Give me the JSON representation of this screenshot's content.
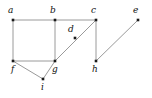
{
  "figure": {
    "name": "undirected-graph-diagram",
    "width": 152,
    "height": 98,
    "background_color": "#ffffff",
    "edge_color": "#9a9a9a",
    "vertex_color": "#1a1a1a",
    "label_color": "#111111",
    "edge_width": 1,
    "vertex_size": 2.6
  },
  "chart_data": {
    "type": "diagram",
    "title": "",
    "vertices": [
      {
        "id": "a",
        "label": "a",
        "x": 13,
        "y": 20,
        "label_x": 8,
        "label_y": 6,
        "degree": 2
      },
      {
        "id": "b",
        "label": "b",
        "x": 55,
        "y": 20,
        "label_x": 50,
        "label_y": 6,
        "degree": 3
      },
      {
        "id": "c",
        "label": "c",
        "x": 96,
        "y": 20,
        "label_x": 91,
        "label_y": 6,
        "degree": 3
      },
      {
        "id": "d",
        "label": "d",
        "x": 75,
        "y": 38,
        "label_x": 68,
        "label_y": 25,
        "degree": 0
      },
      {
        "id": "e",
        "label": "e",
        "x": 138,
        "y": 20,
        "label_x": 133,
        "label_y": 6,
        "degree": 1
      },
      {
        "id": "f",
        "label": "f",
        "x": 13,
        "y": 61,
        "label_x": 11,
        "label_y": 65,
        "degree": 3
      },
      {
        "id": "g",
        "label": "g",
        "x": 55,
        "y": 61,
        "label_x": 52,
        "label_y": 65,
        "degree": 4
      },
      {
        "id": "h",
        "label": "h",
        "x": 96,
        "y": 61,
        "label_x": 92,
        "label_y": 65,
        "degree": 2
      },
      {
        "id": "i",
        "label": "i",
        "x": 43,
        "y": 79,
        "label_x": 41,
        "label_y": 83,
        "degree": 2
      }
    ],
    "edges": [
      {
        "source": "a",
        "target": "b"
      },
      {
        "source": "b",
        "target": "c"
      },
      {
        "source": "a",
        "target": "f"
      },
      {
        "source": "b",
        "target": "g"
      },
      {
        "source": "f",
        "target": "g"
      },
      {
        "source": "f",
        "target": "i"
      },
      {
        "source": "g",
        "target": "i"
      },
      {
        "source": "g",
        "target": "c"
      },
      {
        "source": "c",
        "target": "h"
      },
      {
        "source": "h",
        "target": "e"
      }
    ],
    "edge_count": 10,
    "vertex_count": 9
  }
}
